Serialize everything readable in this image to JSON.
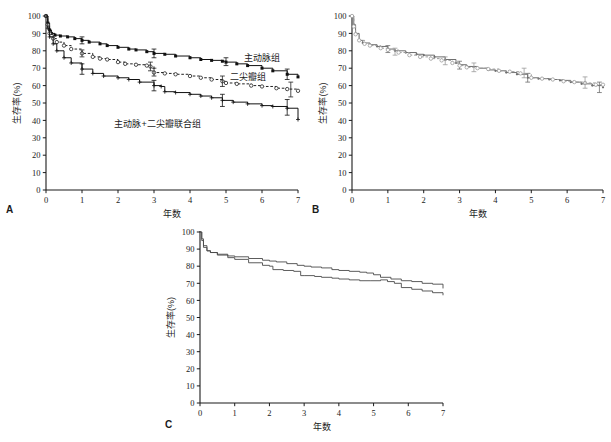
{
  "figure": {
    "panels": [
      {
        "id": "A",
        "letter": "A"
      },
      {
        "id": "B",
        "letter": "B"
      },
      {
        "id": "C",
        "letter": "C"
      }
    ],
    "axis": {
      "ylabel": "生存率(%)",
      "xlabel": "年数",
      "yticks": [
        "0",
        "10",
        "20",
        "30",
        "40",
        "50",
        "60",
        "70",
        "80",
        "90",
        "100"
      ],
      "xticks": [
        "0",
        "1",
        "2",
        "3",
        "4",
        "5",
        "6",
        "7"
      ]
    },
    "colors": {
      "axis": "#1b1b1b",
      "series_dark": "#111111",
      "series_mid": "#6e6e6e",
      "series_light": "#9a9a9a",
      "text": "#1b1b1b"
    },
    "annotations": {
      "aortic": "主动脉组",
      "mitral": "二尖瓣组",
      "combined": "主动脉+二尖瓣联合组"
    }
  },
  "chart_data": [
    {
      "type": "line",
      "panel": "A",
      "title": "",
      "xlabel": "年数",
      "ylabel": "生存率(%)",
      "xlim": [
        0,
        7
      ],
      "ylim": [
        0,
        100
      ],
      "grid": false,
      "legend": "inline-annotations",
      "series": [
        {
          "name": "主动脉组",
          "style": "solid",
          "marker": "filled-square",
          "color": "#111111",
          "x": [
            0,
            0.05,
            0.1,
            0.15,
            0.25,
            0.4,
            0.6,
            0.8,
            1.0,
            1.2,
            1.5,
            1.7,
            2.0,
            2.3,
            2.5,
            2.8,
            3.0,
            3.3,
            3.6,
            4.0,
            4.3,
            4.6,
            4.9,
            5.0,
            5.3,
            5.6,
            6.0,
            6.3,
            6.7,
            7.0
          ],
          "y": [
            100,
            96,
            92,
            90,
            89,
            88.5,
            88,
            87,
            86,
            85,
            84,
            83,
            82,
            81,
            80.5,
            79.5,
            78.5,
            78,
            77,
            76,
            75,
            74.5,
            74,
            73.5,
            72.5,
            71.5,
            70,
            68.5,
            66.5,
            65
          ],
          "errorbars": [
            {
              "x": 1.0,
              "lo": 84,
              "hi": 88
            },
            {
              "x": 3.0,
              "lo": 76,
              "hi": 81
            },
            {
              "x": 5.0,
              "lo": 71.5,
              "hi": 76
            },
            {
              "x": 6.7,
              "lo": 63.5,
              "hi": 69.5
            }
          ]
        },
        {
          "name": "二尖瓣组",
          "style": "dashed",
          "marker": "open-circle",
          "color": "#222222",
          "x": [
            0,
            0.05,
            0.1,
            0.2,
            0.3,
            0.5,
            0.7,
            1.0,
            1.3,
            1.5,
            1.7,
            2.0,
            2.2,
            2.5,
            2.8,
            2.9,
            3.0,
            3.3,
            3.6,
            4.0,
            4.3,
            4.6,
            4.9,
            5.0,
            5.3,
            5.7,
            6.0,
            6.4,
            6.7,
            7.0
          ],
          "y": [
            100,
            95,
            90,
            87,
            85,
            83,
            81,
            78.5,
            76.5,
            75.5,
            75,
            73.5,
            72.5,
            72,
            71.5,
            71,
            67.5,
            67,
            66.5,
            65.5,
            64.5,
            63.5,
            62.5,
            61.5,
            61,
            60,
            59.5,
            58.5,
            58,
            57
          ],
          "errorbars": [
            {
              "x": 1.0,
              "lo": 76.5,
              "hi": 80.5
            },
            {
              "x": 2.9,
              "lo": 68.5,
              "hi": 73.5
            },
            {
              "x": 3.0,
              "lo": 65.5,
              "hi": 70
            },
            {
              "x": 4.9,
              "lo": 59.5,
              "hi": 65.5
            },
            {
              "x": 6.8,
              "lo": 53.5,
              "hi": 62
            }
          ]
        },
        {
          "name": "主动脉+二尖瓣联合组",
          "style": "solid",
          "marker": "plus",
          "color": "#111111",
          "x": [
            0,
            0.05,
            0.1,
            0.2,
            0.3,
            0.5,
            0.7,
            1.0,
            1.3,
            1.6,
            2.0,
            2.3,
            2.6,
            3.0,
            3.2,
            3.3,
            3.6,
            4.0,
            4.3,
            4.6,
            4.9,
            5.2,
            5.6,
            6.0,
            6.3,
            6.7,
            7.0
          ],
          "y": [
            100,
            93,
            88,
            84,
            80,
            76,
            73,
            69.5,
            67,
            65.5,
            64.5,
            63.5,
            62,
            60,
            59.5,
            56.5,
            56,
            55,
            54,
            53,
            51.5,
            50.5,
            49.5,
            48.5,
            48,
            47,
            40.5
          ],
          "errorbars": [
            {
              "x": 1.0,
              "lo": 66.5,
              "hi": 72.5
            },
            {
              "x": 3.0,
              "lo": 57,
              "hi": 63
            },
            {
              "x": 4.9,
              "lo": 48,
              "hi": 55
            },
            {
              "x": 6.7,
              "lo": 43,
              "hi": 52
            }
          ]
        }
      ],
      "annotations": [
        {
          "text": "主动脉组",
          "x": 6.0,
          "y": 74
        },
        {
          "text": "二尖瓣组",
          "x": 5.6,
          "y": 63
        },
        {
          "text": "主动脉+二尖瓣联合组",
          "x": 3.1,
          "y": 36
        }
      ]
    },
    {
      "type": "line",
      "panel": "B",
      "title": "",
      "xlabel": "年数",
      "ylabel": "生存率(%)",
      "xlim": [
        0,
        7
      ],
      "ylim": [
        0,
        100
      ],
      "grid": false,
      "legend": "none",
      "series": [
        {
          "name": "series-1",
          "style": "solid",
          "marker": "small-dot",
          "color": "#6e6e6e",
          "x": [
            0,
            0.05,
            0.1,
            0.2,
            0.3,
            0.5,
            0.7,
            1.0,
            1.2,
            1.5,
            1.8,
            2.0,
            2.3,
            2.6,
            2.9,
            3.0,
            3.2,
            3.5,
            3.8,
            4.0,
            4.3,
            4.6,
            4.9,
            5.2,
            5.5,
            5.8,
            6.1,
            6.4,
            6.7,
            7.0
          ],
          "y": [
            100,
            95,
            90,
            86,
            84.5,
            83.5,
            82.5,
            81,
            80,
            79,
            78,
            77.5,
            76.5,
            75,
            73,
            72,
            71,
            70,
            69,
            68.5,
            67.5,
            66.5,
            64.5,
            64,
            63.5,
            63,
            62,
            61,
            60,
            59
          ],
          "errorbars": [
            {
              "x": 1.0,
              "lo": 79,
              "hi": 83
            },
            {
              "x": 3.0,
              "lo": 69.5,
              "hi": 74
            },
            {
              "x": 4.9,
              "lo": 62,
              "hi": 67
            },
            {
              "x": 6.9,
              "lo": 56,
              "hi": 62
            }
          ]
        },
        {
          "name": "series-2",
          "style": "dashed",
          "marker": "open-circle",
          "color": "#9a9a9a",
          "x": [
            0,
            0.05,
            0.1,
            0.2,
            0.35,
            0.5,
            0.8,
            1.0,
            1.3,
            1.6,
            1.9,
            2.2,
            2.5,
            2.8,
            3.0,
            3.2,
            3.5,
            3.8,
            4.1,
            4.4,
            4.7,
            5.0,
            5.3,
            5.6,
            5.9,
            6.2,
            6.5,
            6.8,
            7.0
          ],
          "y": [
            100,
            94,
            89.5,
            86,
            84,
            83,
            81.5,
            80.5,
            79,
            77.5,
            76.5,
            75.5,
            74.5,
            73,
            71.5,
            70.5,
            70,
            69.5,
            68.5,
            68,
            67,
            64.5,
            64,
            63.5,
            62.5,
            62,
            61.5,
            60.5,
            60.5
          ],
          "errorbars": [
            {
              "x": 1.2,
              "lo": 77.5,
              "hi": 81.5
            },
            {
              "x": 2.6,
              "lo": 72,
              "hi": 76.5
            },
            {
              "x": 3.4,
              "lo": 68,
              "hi": 73
            },
            {
              "x": 4.8,
              "lo": 64.5,
              "hi": 70
            },
            {
              "x": 6.5,
              "lo": 58.5,
              "hi": 65
            }
          ]
        }
      ],
      "annotations": []
    },
    {
      "type": "line",
      "panel": "C",
      "title": "",
      "xlabel": "年数",
      "ylabel": "生存率(%)",
      "xlim": [
        0,
        7
      ],
      "ylim": [
        0,
        100
      ],
      "grid": false,
      "legend": "none",
      "series": [
        {
          "name": "curve-upper",
          "style": "solid",
          "marker": "none",
          "color": "#4a4a4a",
          "x": [
            0,
            0.05,
            0.1,
            0.2,
            0.3,
            0.5,
            0.8,
            1.0,
            1.4,
            1.8,
            2.0,
            2.2,
            2.5,
            2.8,
            3.0,
            3.2,
            3.5,
            3.8,
            4.0,
            4.3,
            4.6,
            4.8,
            5.0,
            5.2,
            5.5,
            5.8,
            6.1,
            6.4,
            6.7,
            7.0
          ],
          "y": [
            100,
            96,
            92,
            89,
            88,
            87,
            86,
            85.5,
            84.5,
            83.5,
            83,
            82.5,
            81.5,
            80.5,
            80,
            79.5,
            79,
            78,
            77.5,
            77,
            76.5,
            76,
            75,
            73.5,
            72.5,
            71.5,
            71,
            70,
            69.5,
            67
          ],
          "errorbars": []
        },
        {
          "name": "curve-lower",
          "style": "solid",
          "marker": "none",
          "color": "#4a4a4a",
          "x": [
            0,
            0.05,
            0.1,
            0.2,
            0.3,
            0.5,
            0.8,
            1.0,
            1.4,
            1.8,
            2.0,
            2.1,
            2.4,
            2.7,
            2.9,
            3.0,
            3.3,
            3.5,
            3.8,
            4.0,
            4.3,
            4.6,
            4.9,
            5.2,
            5.4,
            5.6,
            5.8,
            6.1,
            6.4,
            6.7,
            7.0
          ],
          "y": [
            100,
            95,
            91,
            89,
            88,
            86.5,
            85,
            84,
            82,
            80.5,
            80,
            78,
            77.5,
            77,
            74.5,
            74.5,
            74,
            73.5,
            73,
            72.5,
            72,
            71.5,
            71.5,
            72,
            71,
            70,
            67.5,
            66.5,
            65.5,
            64.5,
            63
          ]
        }
      ],
      "annotations": []
    }
  ]
}
